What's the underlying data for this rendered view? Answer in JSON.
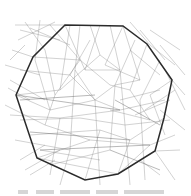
{
  "figure": {
    "colors": {
      "background": "#ffffff",
      "mesh": "#8a8a8a",
      "hull": "#2b2b2b"
    },
    "hull_polygon": [
      [
        65,
        25
      ],
      [
        123,
        26
      ],
      [
        147,
        44
      ],
      [
        172,
        80
      ],
      [
        164,
        118
      ],
      [
        155,
        151
      ],
      [
        118,
        174
      ],
      [
        85,
        180
      ],
      [
        37,
        158
      ],
      [
        16,
        95
      ],
      [
        33,
        57
      ]
    ],
    "mesh_edges": [
      [
        [
          15,
          25
        ],
        [
          65,
          25
        ]
      ],
      [
        [
          20,
          30
        ],
        [
          60,
          40
        ]
      ],
      [
        [
          18,
          40
        ],
        [
          55,
          22
        ]
      ],
      [
        [
          25,
          22
        ],
        [
          45,
          50
        ]
      ],
      [
        [
          30,
          28
        ],
        [
          70,
          45
        ]
      ],
      [
        [
          40,
          20
        ],
        [
          35,
          60
        ]
      ],
      [
        [
          50,
          25
        ],
        [
          80,
          60
        ]
      ],
      [
        [
          70,
          25
        ],
        [
          60,
          90
        ]
      ],
      [
        [
          80,
          25
        ],
        [
          75,
          70
        ]
      ],
      [
        [
          90,
          25
        ],
        [
          100,
          55
        ]
      ],
      [
        [
          100,
          25
        ],
        [
          85,
          70
        ]
      ],
      [
        [
          110,
          25
        ],
        [
          120,
          70
        ]
      ],
      [
        [
          123,
          26
        ],
        [
          105,
          65
        ]
      ],
      [
        [
          130,
          22
        ],
        [
          150,
          45
        ]
      ],
      [
        [
          140,
          30
        ],
        [
          165,
          60
        ]
      ],
      [
        [
          150,
          45
        ],
        [
          175,
          65
        ]
      ],
      [
        [
          123,
          26
        ],
        [
          140,
          80
        ]
      ],
      [
        [
          135,
          40
        ],
        [
          115,
          85
        ]
      ],
      [
        [
          147,
          44
        ],
        [
          130,
          90
        ]
      ],
      [
        [
          160,
          60
        ],
        [
          140,
          100
        ]
      ],
      [
        [
          172,
          80
        ],
        [
          150,
          95
        ]
      ],
      [
        [
          175,
          90
        ],
        [
          145,
          110
        ]
      ],
      [
        [
          165,
          100
        ],
        [
          120,
          110
        ]
      ],
      [
        [
          170,
          120
        ],
        [
          125,
          125
        ]
      ],
      [
        [
          164,
          118
        ],
        [
          130,
          140
        ]
      ],
      [
        [
          175,
          135
        ],
        [
          150,
          145
        ]
      ],
      [
        [
          180,
          150
        ],
        [
          155,
          151
        ]
      ],
      [
        [
          33,
          57
        ],
        [
          80,
          60
        ]
      ],
      [
        [
          20,
          70
        ],
        [
          70,
          75
        ]
      ],
      [
        [
          16,
          95
        ],
        [
          60,
          90
        ]
      ],
      [
        [
          10,
          80
        ],
        [
          45,
          100
        ]
      ],
      [
        [
          5,
          65
        ],
        [
          40,
          75
        ]
      ],
      [
        [
          35,
          60
        ],
        [
          50,
          110
        ]
      ],
      [
        [
          45,
          50
        ],
        [
          55,
          95
        ]
      ],
      [
        [
          55,
          95
        ],
        [
          80,
          60
        ]
      ],
      [
        [
          60,
          90
        ],
        [
          100,
          55
        ]
      ],
      [
        [
          75,
          70
        ],
        [
          95,
          100
        ]
      ],
      [
        [
          80,
          60
        ],
        [
          110,
          85
        ]
      ],
      [
        [
          85,
          70
        ],
        [
          120,
          70
        ]
      ],
      [
        [
          100,
          55
        ],
        [
          120,
          70
        ]
      ],
      [
        [
          105,
          65
        ],
        [
          140,
          80
        ]
      ],
      [
        [
          115,
          85
        ],
        [
          140,
          80
        ]
      ],
      [
        [
          110,
          85
        ],
        [
          130,
          90
        ]
      ],
      [
        [
          95,
          100
        ],
        [
          115,
          85
        ]
      ],
      [
        [
          95,
          100
        ],
        [
          120,
          110
        ]
      ],
      [
        [
          70,
          75
        ],
        [
          95,
          100
        ]
      ],
      [
        [
          50,
          110
        ],
        [
          95,
          100
        ]
      ],
      [
        [
          16,
          95
        ],
        [
          50,
          110
        ]
      ],
      [
        [
          10,
          115
        ],
        [
          60,
          118
        ]
      ],
      [
        [
          5,
          105
        ],
        [
          45,
          125
        ]
      ],
      [
        [
          20,
          120
        ],
        [
          80,
          118
        ]
      ],
      [
        [
          60,
          118
        ],
        [
          120,
          110
        ]
      ],
      [
        [
          80,
          118
        ],
        [
          125,
          125
        ]
      ],
      [
        [
          45,
          125
        ],
        [
          90,
          140
        ]
      ],
      [
        [
          30,
          135
        ],
        [
          100,
          130
        ]
      ],
      [
        [
          100,
          130
        ],
        [
          130,
          140
        ]
      ],
      [
        [
          90,
          140
        ],
        [
          150,
          145
        ]
      ],
      [
        [
          15,
          140
        ],
        [
          70,
          150
        ]
      ],
      [
        [
          37,
          158
        ],
        [
          90,
          140
        ]
      ],
      [
        [
          40,
          150
        ],
        [
          100,
          160
        ]
      ],
      [
        [
          37,
          158
        ],
        [
          118,
          174
        ]
      ],
      [
        [
          50,
          165
        ],
        [
          110,
          150
        ]
      ],
      [
        [
          25,
          170
        ],
        [
          60,
          150
        ]
      ],
      [
        [
          85,
          180
        ],
        [
          100,
          130
        ]
      ],
      [
        [
          118,
          174
        ],
        [
          130,
          140
        ]
      ],
      [
        [
          118,
          174
        ],
        [
          150,
          145
        ]
      ],
      [
        [
          140,
          160
        ],
        [
          160,
          175
        ]
      ],
      [
        [
          155,
          151
        ],
        [
          175,
          180
        ]
      ],
      [
        [
          60,
          118
        ],
        [
          50,
          175
        ]
      ],
      [
        [
          70,
          150
        ],
        [
          60,
          185
        ]
      ],
      [
        [
          95,
          100
        ],
        [
          100,
          185
        ]
      ],
      [
        [
          125,
          125
        ],
        [
          130,
          185
        ]
      ],
      [
        [
          140,
          100
        ],
        [
          145,
          180
        ]
      ],
      [
        [
          150,
          95
        ],
        [
          165,
          135
        ]
      ],
      [
        [
          130,
          90
        ],
        [
          150,
          120
        ]
      ],
      [
        [
          115,
          85
        ],
        [
          110,
          150
        ]
      ],
      [
        [
          75,
          70
        ],
        [
          70,
          150
        ]
      ],
      [
        [
          55,
          95
        ],
        [
          45,
          125
        ]
      ],
      [
        [
          120,
          70
        ],
        [
          125,
          125
        ]
      ],
      [
        [
          25,
          45
        ],
        [
          10,
          60
        ]
      ],
      [
        [
          12,
          50
        ],
        [
          33,
          57
        ]
      ],
      [
        [
          8,
          88
        ],
        [
          30,
          100
        ]
      ],
      [
        [
          20,
          160
        ],
        [
          45,
          145
        ]
      ],
      [
        [
          30,
          175
        ],
        [
          55,
          160
        ]
      ],
      [
        [
          150,
          30
        ],
        [
          180,
          50
        ]
      ],
      [
        [
          160,
          45
        ],
        [
          185,
          75
        ]
      ],
      [
        [
          165,
          70
        ],
        [
          185,
          110
        ]
      ],
      [
        [
          172,
          80
        ],
        [
          185,
          95
        ]
      ],
      [
        [
          160,
          110
        ],
        [
          185,
          130
        ]
      ],
      [
        [
          65,
          25
        ],
        [
          85,
          70
        ]
      ],
      [
        [
          90,
          40
        ],
        [
          70,
          75
        ]
      ],
      [
        [
          130,
          50
        ],
        [
          160,
          75
        ]
      ],
      [
        [
          120,
          100
        ],
        [
          160,
          90
        ]
      ],
      [
        [
          135,
          115
        ],
        [
          170,
          100
        ]
      ],
      [
        [
          110,
          110
        ],
        [
          150,
          120
        ]
      ]
    ],
    "dark_mesh_edges": [
      [
        [
          20,
          100
        ],
        [
          95,
          95
        ]
      ],
      [
        [
          16,
          95
        ],
        [
          120,
          110
        ]
      ],
      [
        [
          30,
          132
        ],
        [
          130,
          140
        ]
      ],
      [
        [
          40,
          150
        ],
        [
          150,
          145
        ]
      ],
      [
        [
          115,
          100
        ],
        [
          160,
          125
        ]
      ],
      [
        [
          110,
          150
        ],
        [
          160,
          170
        ]
      ]
    ],
    "caption": {
      "visible": true,
      "legible": false
    }
  }
}
